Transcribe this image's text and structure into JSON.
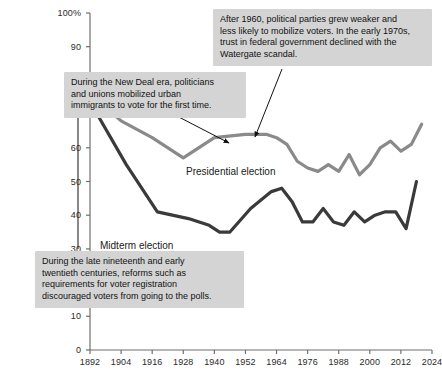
{
  "chart_data": {
    "type": "line",
    "title": "",
    "xlabel": "",
    "ylabel": "",
    "xlim": [
      1892,
      2024
    ],
    "ylim": [
      0,
      100
    ],
    "grid": false,
    "legend_position": "inline-labels",
    "y_ticks": [
      "0",
      "10",
      "20",
      "30",
      "40",
      "50",
      "60",
      "70",
      "80",
      "90",
      "100%"
    ],
    "y_tick_values": [
      0,
      10,
      20,
      30,
      40,
      50,
      60,
      70,
      80,
      90,
      100
    ],
    "x_ticks": [
      "1892",
      "1904",
      "1916",
      "1928",
      "1940",
      "1952",
      "1964",
      "1976",
      "1988",
      "2000",
      "2012",
      "2024"
    ],
    "x_tick_values": [
      1892,
      1904,
      1916,
      1928,
      1940,
      1952,
      1964,
      1976,
      1988,
      2000,
      2012,
      2024
    ],
    "series": [
      {
        "name": "Presidential election",
        "color": "#8a8a8a",
        "x": [
          1892,
          1904,
          1916,
          1928,
          1936,
          1940,
          1952,
          1960,
          1964,
          1968,
          1972,
          1976,
          1980,
          1984,
          1988,
          1992,
          1996,
          2000,
          2004,
          2008,
          2012,
          2016,
          2020
        ],
        "values": [
          76,
          68,
          63,
          57,
          61,
          63,
          64,
          64,
          63,
          61,
          56,
          54,
          53,
          55,
          53,
          58,
          52,
          55,
          60,
          62,
          59,
          61,
          67
        ]
      },
      {
        "name": "Midterm election",
        "color": "#3a3a3a",
        "x": [
          1894,
          1906,
          1918,
          1930,
          1938,
          1942,
          1946,
          1954,
          1962,
          1966,
          1970,
          1974,
          1978,
          1982,
          1986,
          1990,
          1994,
          1998,
          2002,
          2006,
          2010,
          2014,
          2018
        ],
        "values": [
          71,
          55,
          41,
          39,
          37,
          35,
          35,
          42,
          47,
          48,
          44,
          38,
          38,
          42,
          38,
          37,
          41,
          38,
          40,
          41,
          41,
          36,
          50
        ]
      }
    ],
    "series_labels": [
      {
        "text": "Presidential election",
        "x_px": 186,
        "y_px": 166
      },
      {
        "text": "Midterm election",
        "x_px": 100,
        "y_px": 240
      }
    ],
    "annotations": [
      {
        "id": "new-deal-note",
        "lines": [
          "During the New Deal era, politicians",
          "and unions mobilized urban",
          "immigrants to vote for the first time."
        ],
        "box": {
          "left": 64,
          "top": 72,
          "width": 182,
          "height": 42
        },
        "arrow": {
          "x1": 175,
          "y1": 115,
          "x2": 229,
          "y2": 143
        }
      },
      {
        "id": "post-1960-note",
        "lines": [
          "After 1960, political parties grew weaker and",
          "less likely to mobilize voters. In the early 1970s,",
          "trust in federal government declined with the",
          "Watergate scandal."
        ],
        "box": {
          "left": 213,
          "top": 9,
          "width": 219,
          "height": 54
        },
        "arrow": {
          "x1": 282,
          "y1": 69,
          "x2": 255,
          "y2": 137
        }
      },
      {
        "id": "reform-note",
        "lines": [
          "During the late nineteenth and early",
          "twentieth centuries, reforms such as",
          "requirements for voter registration",
          "discouraged voters from going to the polls."
        ],
        "box": {
          "left": 35,
          "top": 251,
          "width": 209,
          "height": 54
        },
        "arrow": {
          "x1": 78,
          "y1": 249,
          "x2": 78,
          "y2": 107
        }
      }
    ]
  }
}
